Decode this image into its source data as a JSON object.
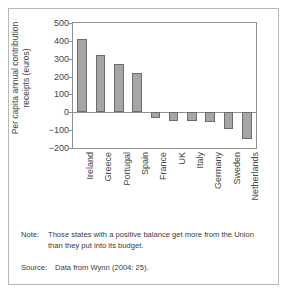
{
  "figure": {
    "note_tag": "Note:",
    "note_text": "Those states with a positive balance get more from the Union than they put into its budget.",
    "source_tag": "Source:",
    "source_text": "Data from Wynn (2004: 25)."
  },
  "chart_data": {
    "type": "bar",
    "title": "",
    "xlabel": "",
    "ylabel": "Per capita annual contribution receipts (euros)",
    "categories": [
      "Ireland",
      "Greece",
      "Portugal",
      "Spain",
      "France",
      "UK",
      "Italy",
      "Germany",
      "Sweden",
      "Netherlands"
    ],
    "values": [
      410,
      320,
      268,
      222,
      -33,
      -47,
      -47,
      -57,
      -95,
      -148
    ],
    "ylim": [
      -200,
      500
    ],
    "yticks": [
      500,
      400,
      300,
      200,
      100,
      0,
      -100,
      -200
    ],
    "ytick_labels": [
      "500",
      "400",
      "300",
      "200",
      "100",
      "0",
      "−100",
      "−200"
    ],
    "grid": false,
    "legend": false,
    "bar_color": "#a6a6a6",
    "bar_edge_color": "#6d6d6d",
    "axis_color": "#8f8f8f"
  }
}
